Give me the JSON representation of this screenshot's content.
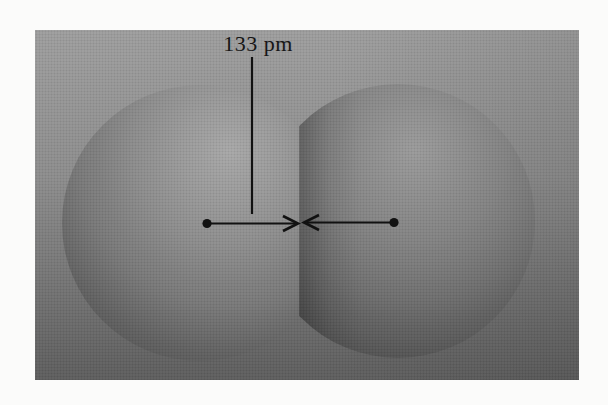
{
  "figure": {
    "distance_label": "133 pm",
    "colors": {
      "page_background": "#fbfbfa",
      "panel_top": "#9e9e9e",
      "panel_bottom": "#5e5e5e",
      "sphere_left_highlight": "#a8a8a8",
      "sphere_left_edge": "#4a4a4a",
      "sphere_right_highlight": "#9a9a9a",
      "sphere_right_edge": "#454545",
      "annotation_ink": "#111111"
    }
  }
}
